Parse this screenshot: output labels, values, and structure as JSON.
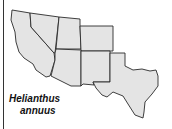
{
  "map": {
    "region": "Southwestern United States",
    "species_label_line1": "Helianthus",
    "species_label_line2": "annuus",
    "fill_color": "#e4e4e4",
    "stroke_color": "#2a2a2a"
  }
}
